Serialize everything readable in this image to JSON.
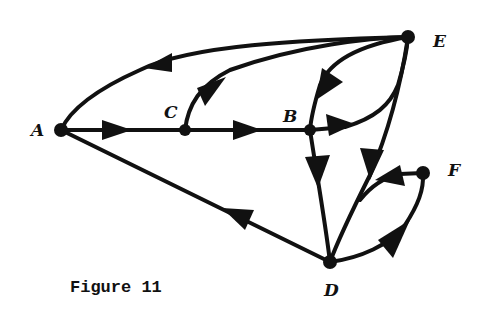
{
  "figure": {
    "caption": "Figure 11",
    "stroke_color": "#111111",
    "background": "#ffffff"
  },
  "nodes": {
    "A": {
      "label": "A",
      "x": 61,
      "y": 130
    },
    "B": {
      "label": "B",
      "x": 310,
      "y": 130
    },
    "C": {
      "label": "C",
      "x": 185,
      "y": 130
    },
    "D": {
      "label": "D",
      "x": 330,
      "y": 262
    },
    "E": {
      "label": "E",
      "x": 408,
      "y": 37
    },
    "F": {
      "label": "F",
      "x": 423,
      "y": 173
    }
  },
  "edges": [
    {
      "from": "E",
      "to": "A"
    },
    {
      "from": "C",
      "to": "E"
    },
    {
      "from": "A",
      "to": "C"
    },
    {
      "from": "C",
      "to": "B"
    },
    {
      "from": "E",
      "to": "B"
    },
    {
      "from": "B",
      "to": "E"
    },
    {
      "from": "B",
      "to": "D"
    },
    {
      "from": "E",
      "to": "D"
    },
    {
      "from": "D",
      "to": "A"
    },
    {
      "from": "F",
      "to": "D"
    },
    {
      "from": "D",
      "to": "F"
    }
  ]
}
